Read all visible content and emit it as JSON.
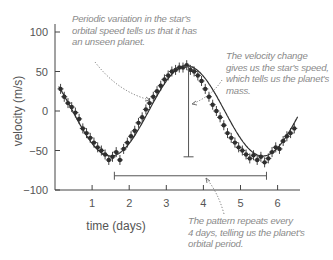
{
  "chart_data": {
    "type": "scatter",
    "title": "",
    "xlabel": "time (days)",
    "ylabel": "velocity (m/s)",
    "xlim": [
      0,
      6.6
    ],
    "ylim": [
      -100,
      100
    ],
    "x_ticks": [
      1,
      2,
      3,
      4,
      5,
      6
    ],
    "y_ticks": [
      100,
      50,
      0,
      -50,
      -100
    ],
    "y_tick_labels": [
      "100",
      "50",
      "0",
      "−50",
      "−100"
    ],
    "grid": false,
    "legend": null,
    "model": {
      "form": "sinusoid",
      "amplitude": 57,
      "period_days": 4.1,
      "peak_day": 3.55,
      "offset": 0
    },
    "series": [
      {
        "name": "measured radial velocity",
        "x": [
          0.15,
          0.25,
          0.35,
          0.45,
          0.55,
          0.65,
          0.75,
          0.85,
          0.95,
          1.05,
          1.15,
          1.25,
          1.35,
          1.45,
          1.55,
          1.65,
          1.75,
          1.85,
          1.95,
          2.05,
          2.15,
          2.25,
          2.35,
          2.45,
          2.55,
          2.65,
          2.75,
          2.85,
          2.95,
          3.05,
          3.15,
          3.25,
          3.35,
          3.45,
          3.55,
          3.65,
          3.75,
          3.85,
          3.95,
          4.05,
          4.15,
          4.25,
          4.35,
          4.45,
          4.55,
          4.65,
          4.75,
          4.85,
          4.95,
          5.05,
          5.15,
          5.25,
          5.35,
          5.45,
          5.55,
          5.65,
          5.75,
          5.85,
          5.95,
          6.05,
          6.15,
          6.25,
          6.35,
          6.45
        ],
        "y": [
          28,
          18,
          10,
          5,
          -2,
          -10,
          -22,
          -28,
          -34,
          -40,
          -46,
          -50,
          -55,
          -62,
          -58,
          -52,
          -62,
          -48,
          -40,
          -32,
          -25,
          -15,
          -8,
          2,
          10,
          18,
          25,
          32,
          40,
          45,
          50,
          52,
          55,
          55,
          58,
          52,
          50,
          45,
          38,
          28,
          18,
          8,
          0,
          -8,
          -18,
          -28,
          -34,
          -40,
          -46,
          -50,
          -55,
          -60,
          -56,
          -62,
          -58,
          -65,
          -60,
          -52,
          -46,
          -48,
          -38,
          -32,
          -28,
          -22
        ]
      }
    ],
    "annotations": [
      {
        "text": "Periodic variation in the star's orbital speed tells us that it has an unseen planet.",
        "points_to": [
          2.5,
          10
        ]
      },
      {
        "text": "The velocity change gives us the star's speed, which tells us the planet's mass.",
        "points_to": [
          3.6,
          0
        ],
        "bracket": {
          "type": "vertical",
          "x": 3.6,
          "y_from": 56,
          "y_to": -58
        }
      },
      {
        "text": "The pattern repeats every 4 days, telling us the planet's orbital period.",
        "points_to": [
          4.05,
          -82
        ],
        "bracket": {
          "type": "horizontal",
          "y": -82,
          "x_from": 1.6,
          "x_to": 5.7
        }
      }
    ]
  },
  "annotations": {
    "periodic": [
      "Periodic variation in the star's",
      "orbital speed tells us that it has",
      "an unseen planet."
    ],
    "velocity": [
      "The velocity change",
      "gives us the star's speed,",
      "which tells us the planet's",
      "mass."
    ],
    "pattern": [
      "The pattern repeats every",
      "4 days, telling us the planet's",
      "orbital period."
    ]
  },
  "colors": {
    "axis": "#444444",
    "points": "#2e2e2e",
    "annotation_text": "#8a8a8a",
    "bracket": "#555555"
  }
}
